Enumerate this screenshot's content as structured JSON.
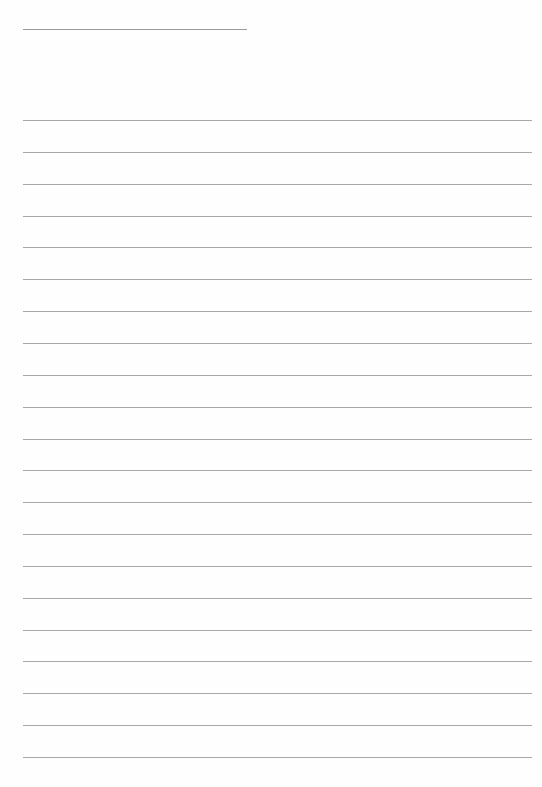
{
  "document": {
    "type": "blank lined paper",
    "header_line": {
      "x": 23,
      "y": 29,
      "width": 224
    },
    "rules": {
      "count": 21,
      "start_y": 120,
      "spacing": 31.85,
      "x": 23,
      "width": 509
    },
    "colors": {
      "background": "#fefefe",
      "line": "#a8a8a8"
    }
  }
}
